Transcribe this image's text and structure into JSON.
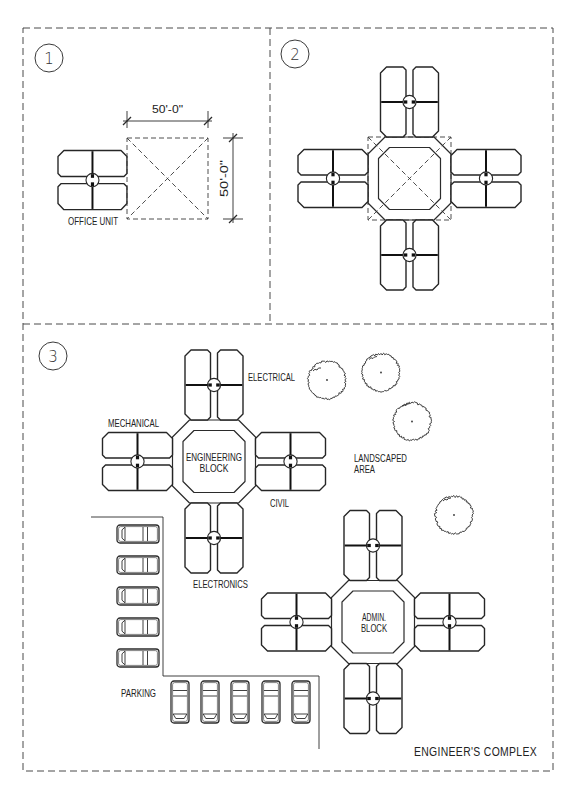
{
  "drawing": {
    "title": "ENGINEER'S COMPLEX",
    "colors": {
      "ink": "#2b2b2b",
      "background": "#ffffff",
      "border": "#4a4a4a"
    },
    "panel_1": {
      "number": "1",
      "office_unit_label": "OFFICE UNIT",
      "dimension_width": "50'-0\"",
      "dimension_height": "50'-0\""
    },
    "panel_2": {
      "number": "2"
    },
    "panel_3": {
      "number": "3",
      "engineering_block": {
        "line1": "ENGINEERING",
        "line2": "BLOCK"
      },
      "wings": {
        "top": "ELECTRICAL",
        "left": "MECHANICAL",
        "right": "CIVIL",
        "bottom": "ELECTRONICS"
      },
      "landscaped_area": {
        "line1": "LANDSCAPED",
        "line2": "AREA"
      },
      "admin_block": {
        "line1": "ADMIN.",
        "line2": "BLOCK"
      },
      "parking_label": "PARKING",
      "trees": 4,
      "parked_cars": {
        "left_column": 5,
        "bottom_row": 5
      },
      "title": "ENGINEER'S COMPLEX"
    }
  }
}
